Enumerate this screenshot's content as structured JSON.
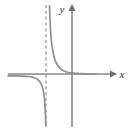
{
  "figure": {
    "name": "rational-function-graph",
    "background_color": "#ffffff",
    "axis_color": "#8a8a8a",
    "curve_color": "#8f8f8f",
    "asymptote_color": "#9a9a9a",
    "label_color": "#2b2b2b"
  },
  "labels": {
    "x_axis": "x",
    "y_axis": "y"
  },
  "chart_data": {
    "type": "line",
    "title": "",
    "xlabel": "x",
    "ylabel": "y",
    "grid": false,
    "legend": null,
    "axes": {
      "x_axis_pixel_y": 74,
      "y_axis_pixel_x": 72,
      "x_axis_start_px": 8,
      "x_axis_end_px": 116,
      "y_axis_top_px": 4,
      "y_axis_bottom_px": 127,
      "x_arrow": true,
      "y_arrow": true
    },
    "annotations": [
      {
        "kind": "vertical-asymptote",
        "style": "dashed",
        "pixel_x": 46,
        "pixel_y_top": 5,
        "pixel_y_bottom": 127
      },
      {
        "kind": "horizontal-asymptote",
        "style": "implicit-x-axis",
        "pixel_y": 74
      }
    ],
    "series": [
      {
        "name": "upper-right-branch",
        "points_px": [
          [
            49.5,
            6
          ],
          [
            49.8,
            14
          ],
          [
            50.2,
            24
          ],
          [
            50.8,
            34
          ],
          [
            51.6,
            43
          ],
          [
            52.8,
            51
          ],
          [
            54.4,
            58
          ],
          [
            56.6,
            63.5
          ],
          [
            59.4,
            67.6
          ],
          [
            63.0,
            70.4
          ],
          [
            67.5,
            72.2
          ],
          [
            73.0,
            73.2
          ],
          [
            80.0,
            73.7
          ],
          [
            88.0,
            73.9
          ],
          [
            96.0,
            74.0
          ]
        ]
      },
      {
        "name": "lower-left-branch",
        "points_px": [
          [
            8.0,
            75.8
          ],
          [
            16.0,
            75.9
          ],
          [
            23.0,
            76.1
          ],
          [
            28.5,
            76.5
          ],
          [
            32.8,
            77.3
          ],
          [
            36.2,
            78.6
          ],
          [
            38.9,
            80.6
          ],
          [
            40.9,
            83.4
          ],
          [
            42.4,
            87.2
          ],
          [
            43.5,
            92.0
          ],
          [
            44.3,
            98.0
          ],
          [
            44.9,
            105.0
          ],
          [
            45.3,
            112.0
          ],
          [
            45.6,
            119.0
          ],
          [
            45.8,
            126.0
          ]
        ]
      }
    ]
  }
}
